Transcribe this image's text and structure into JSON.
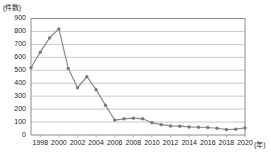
{
  "chart_data": {
    "type": "line",
    "title": "",
    "ylabel": "(件数)",
    "xlabel": "(年)",
    "ylim": [
      0,
      900
    ],
    "ytick_values": [
      0,
      100,
      200,
      300,
      400,
      500,
      600,
      700,
      800,
      900
    ],
    "ytick_labels": [
      "0",
      "100",
      "200",
      "300",
      "400",
      "500",
      "600",
      "700",
      "800",
      "900"
    ],
    "xlim": [
      1997,
      2020
    ],
    "xtick_labels": [
      "1998",
      "2000",
      "2002",
      "2004",
      "2006",
      "2008",
      "2010",
      "2012",
      "2014",
      "2016",
      "2018",
      "2020"
    ],
    "xtick_values": [
      1998,
      2000,
      2002,
      2004,
      2006,
      2008,
      2010,
      2012,
      2014,
      2016,
      2018,
      2020
    ],
    "grid": true,
    "legend": "none",
    "series": [
      {
        "name": "件数",
        "color": "#8a8a8a",
        "x": [
          1997,
          1998,
          1999,
          2000,
          2001,
          2002,
          2003,
          2004,
          2005,
          2006,
          2007,
          2008,
          2009,
          2010,
          2011,
          2012,
          2013,
          2014,
          2015,
          2016,
          2017,
          2018,
          2019,
          2020
        ],
        "values": [
          520,
          640,
          750,
          820,
          515,
          365,
          450,
          350,
          230,
          115,
          125,
          130,
          125,
          95,
          80,
          70,
          68,
          62,
          60,
          58,
          52,
          42,
          45,
          55
        ]
      }
    ]
  }
}
